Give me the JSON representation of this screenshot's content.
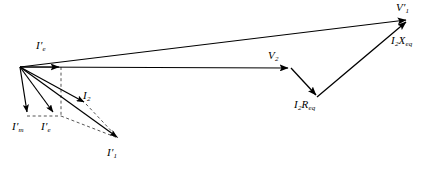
{
  "diagram": {
    "type": "phasor-diagram",
    "background_color": "#ffffff",
    "stroke_color": "#000000",
    "dashed_color": "#555555",
    "width": 444,
    "height": 171,
    "origin": {
      "x": 20,
      "y": 67
    },
    "labels": [
      {
        "id": "v1p",
        "symbol": "V",
        "sub": "1",
        "prime": true,
        "x": 396,
        "y": 3,
        "name": "label-v1-primary-voltage"
      },
      {
        "id": "i2xeq",
        "symbol": "I",
        "sub": "2",
        "prime": false,
        "op": "X",
        "opsub": "eq",
        "x": 392,
        "y": 36,
        "name": "label-i2xeq-reactance-drop"
      },
      {
        "id": "v2",
        "symbol": "V",
        "sub": "2",
        "prime": false,
        "x": 268,
        "y": 51,
        "name": "label-v2-secondary-voltage"
      },
      {
        "id": "i2req",
        "symbol": "I",
        "sub": "2",
        "prime": false,
        "op": "R",
        "opsub": "eq",
        "x": 294,
        "y": 99,
        "name": "label-i2req-resistance-drop"
      },
      {
        "id": "iep",
        "symbol": "I",
        "sub": "e",
        "prime": true,
        "x": 36,
        "y": 41,
        "name": "label-ie-exciting-current-top"
      },
      {
        "id": "i2",
        "symbol": "I",
        "sub": "2",
        "prime": false,
        "x": 83,
        "y": 91,
        "name": "label-i2-secondary-current"
      },
      {
        "id": "imp",
        "symbol": "I",
        "sub": "m",
        "prime": true,
        "x": 13,
        "y": 122,
        "name": "label-im-magnetizing-current"
      },
      {
        "id": "iep2",
        "symbol": "I",
        "sub": "e",
        "prime": true,
        "x": 41,
        "y": 122,
        "name": "label-ie-core-loss-current"
      },
      {
        "id": "i1p",
        "symbol": "I",
        "sub": "1",
        "prime": true,
        "x": 107,
        "y": 148,
        "name": "label-i1-primary-current"
      }
    ],
    "vectors": [
      {
        "id": "v1p-vec",
        "name": "vector-v1-primary-voltage",
        "x1": 20,
        "y1": 67,
        "x2": 408,
        "y2": 19,
        "style": "solid",
        "arrow": true
      },
      {
        "id": "v2-vec",
        "name": "vector-v2-secondary-voltage",
        "x1": 20,
        "y1": 67,
        "x2": 290,
        "y2": 68,
        "style": "solid",
        "arrow": true
      },
      {
        "id": "i2req-vec",
        "name": "vector-i2req-resistance-drop",
        "x1": 292,
        "y1": 68,
        "x2": 317,
        "y2": 97,
        "style": "solid",
        "arrow": true
      },
      {
        "id": "i2xeq-vec",
        "name": "vector-i2xeq-reactance-drop",
        "x1": 317,
        "y1": 97,
        "x2": 408,
        "y2": 20,
        "style": "solid",
        "arrow": true
      },
      {
        "id": "iep-vec",
        "name": "vector-ie-exciting-current",
        "x1": 20,
        "y1": 67,
        "x2": 61,
        "y2": 67,
        "style": "solid",
        "arrow": true
      },
      {
        "id": "imp-vec",
        "name": "vector-im-magnetizing-current",
        "x1": 20,
        "y1": 67,
        "x2": 27,
        "y2": 115,
        "style": "solid",
        "arrow": true
      },
      {
        "id": "iec-vec",
        "name": "vector-ie-core-loss-current",
        "x1": 20,
        "y1": 67,
        "x2": 54,
        "y2": 115,
        "style": "solid",
        "arrow": true
      },
      {
        "id": "i2-vec",
        "name": "vector-i2-secondary-current",
        "x1": 20,
        "y1": 67,
        "x2": 86,
        "y2": 104,
        "style": "solid",
        "arrow": true
      },
      {
        "id": "i1p-vec",
        "name": "vector-i1-primary-current",
        "x1": 20,
        "y1": 67,
        "x2": 119,
        "y2": 139,
        "style": "solid",
        "arrow": true
      }
    ],
    "construction_lines": [
      {
        "id": "dash-vert-ie",
        "name": "dashed-vertical-from-ie-tip",
        "x1": 61,
        "y1": 67,
        "x2": 61,
        "y2": 116,
        "style": "dashed"
      },
      {
        "id": "dash-horiz-im",
        "name": "dashed-horizontal-im-to-ie",
        "x1": 27,
        "y1": 116,
        "x2": 61,
        "y2": 116,
        "style": "dashed"
      },
      {
        "id": "dash-ie-to-i1",
        "name": "dashed-ie-to-i1-tip",
        "x1": 61,
        "y1": 116,
        "x2": 119,
        "y2": 139,
        "style": "dashed"
      },
      {
        "id": "dash-i2-to-i1",
        "name": "dashed-i2-to-i1-tip",
        "x1": 86,
        "y1": 104,
        "x2": 119,
        "y2": 139,
        "style": "dashed"
      }
    ]
  }
}
